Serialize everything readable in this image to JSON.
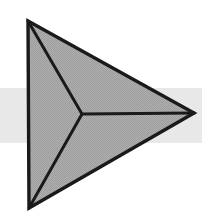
{
  "canvas": {
    "width": 202,
    "height": 217,
    "background_color": "#ffffff",
    "title": "Geometric Arrow Icon"
  },
  "background_band": {
    "label": "Horizontal Gray Band",
    "color": "#e8e8e8",
    "x": 0,
    "y": 88,
    "width": 202,
    "height": 55
  },
  "figure": {
    "label": "Three-Faced Arrowhead",
    "outline_color": "#1a1a1a",
    "fill_color": "#a8a8a8",
    "fill_pattern": "dither-halftone",
    "dither_dot_color": "#8f8f8f",
    "outline_width": 3,
    "ridge_width": 3,
    "vertices": {
      "top_left": {
        "x": 28,
        "y": 21
      },
      "right_tip": {
        "x": 194,
        "y": 113
      },
      "bottom_left": {
        "x": 29,
        "y": 208
      },
      "center_junction": {
        "x": 82,
        "y": 114
      }
    },
    "faces": [
      {
        "name": "upper-face",
        "points": "28,21 194,113 82,114",
        "tone": "#a8a8a8"
      },
      {
        "name": "lower-face",
        "points": "29,208 194,113 82,114",
        "tone": "#a8a8a8"
      },
      {
        "name": "left-face",
        "points": "28,21 82,114 29,208",
        "tone": "#a8a8a8"
      }
    ],
    "ridges": [
      {
        "name": "ridge-upper",
        "x1": 28,
        "y1": 21,
        "x2": 82,
        "y2": 114
      },
      {
        "name": "ridge-lower",
        "x1": 29,
        "y1": 208,
        "x2": 82,
        "y2": 114
      },
      {
        "name": "ridge-right",
        "x1": 82,
        "y1": 114,
        "x2": 194,
        "y2": 113
      }
    ],
    "outline_path": "M28,21 L194,113 L29,208 Z"
  }
}
